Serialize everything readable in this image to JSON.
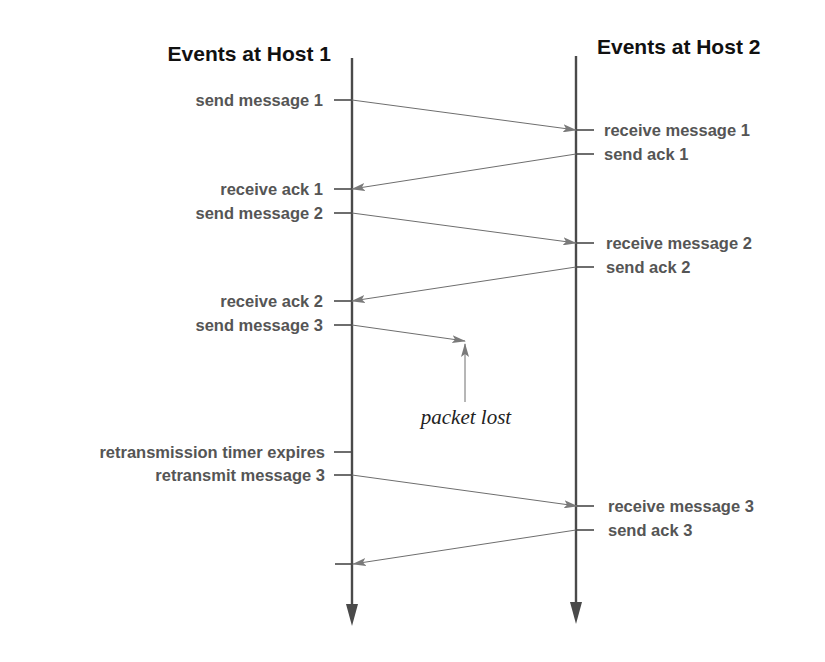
{
  "diagram": {
    "type": "sequence / timeline diagram",
    "colors": {
      "background": "#ffffff",
      "title": "#111111",
      "labels": "#555555",
      "timeline": "#4a4a4a",
      "message_line": "#6e6e6e",
      "arrowhead": "#7a7a7a"
    },
    "hosts": [
      {
        "id": "host1",
        "title": "Events at Host 1",
        "x": 352
      },
      {
        "id": "host2",
        "title": "Events at Host 2",
        "x": 576
      }
    ],
    "host1_events": [
      {
        "label": "send message 1",
        "y": 100
      },
      {
        "label": "receive ack 1",
        "y": 189
      },
      {
        "label": "send message 2",
        "y": 213
      },
      {
        "label": "receive ack 2",
        "y": 301
      },
      {
        "label": "send message 3",
        "y": 325
      },
      {
        "label": "retransmission timer expires",
        "y": 452
      },
      {
        "label": "retransmit message 3",
        "y": 475
      },
      {
        "label": "",
        "y": 564
      }
    ],
    "host2_events": [
      {
        "label": "receive message 1",
        "y": 130
      },
      {
        "label": "send ack 1",
        "y": 154
      },
      {
        "label": "receive message 2",
        "y": 243
      },
      {
        "label": "send ack 2",
        "y": 267
      },
      {
        "label": "receive message 3",
        "y": 506
      },
      {
        "label": "send ack 3",
        "y": 530
      }
    ],
    "messages": [
      {
        "name": "message 1",
        "from": "host1",
        "to": "host2",
        "y1": 100,
        "y2": 130
      },
      {
        "name": "ack 1",
        "from": "host2",
        "to": "host1",
        "y1": 154,
        "y2": 189
      },
      {
        "name": "message 2",
        "from": "host1",
        "to": "host2",
        "y1": 213,
        "y2": 243
      },
      {
        "name": "ack 2",
        "from": "host2",
        "to": "host1",
        "y1": 267,
        "y2": 301
      },
      {
        "name": "message 3 (lost)",
        "from": "host1",
        "to": "lost",
        "y1": 325,
        "y2": 341
      },
      {
        "name": "message 3 (retransmitted)",
        "from": "host1",
        "to": "host2",
        "y1": 475,
        "y2": 506
      },
      {
        "name": "ack 3",
        "from": "host2",
        "to": "host1",
        "y1": 530,
        "y2": 564
      }
    ],
    "annotation": {
      "text": "packet lost"
    }
  }
}
